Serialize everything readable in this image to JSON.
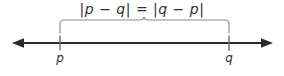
{
  "figure": {
    "title_formula": "|p − q| = |q − p|",
    "background_color": "#ffffff",
    "line_color": "#2b2b2b",
    "brace_color": "#8a8a8a",
    "tick_color": "#6e6e6e",
    "text_color": "#2f2f2f"
  },
  "number_line": {
    "left_arrow_tip_x": 12,
    "right_arrow_tip_x": 273,
    "axis_y": 43,
    "points": [
      {
        "label": "p",
        "x": 60
      },
      {
        "label": "q",
        "x": 229
      }
    ]
  },
  "brace": {
    "left_x": 60,
    "right_x": 229,
    "peak_x": 144,
    "top_y": 19,
    "bottom_y": 33,
    "spans_label": "distance between p and q"
  }
}
